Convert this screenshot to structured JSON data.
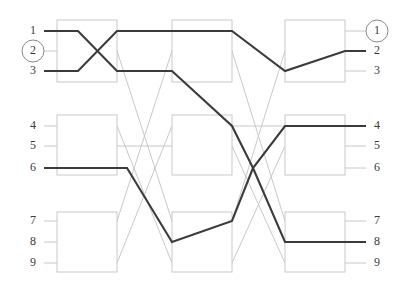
{
  "figure": {
    "width": 406,
    "height": 290,
    "background_color": "#ffffff",
    "active_wire_color": "#3b3b3b",
    "dim_wire_color": "#c2c2c2",
    "box_stroke_color": "#c9c9c9",
    "label_color": "#3a3a3a",
    "ring_color": "#8a8a8a"
  },
  "left_labels": [
    {
      "text": "1",
      "y": 31,
      "ringed": false
    },
    {
      "text": "2",
      "y": 51,
      "ringed": true
    },
    {
      "text": "3",
      "y": 71,
      "ringed": false
    },
    {
      "text": "4",
      "y": 126,
      "ringed": false
    },
    {
      "text": "5",
      "y": 146,
      "ringed": false
    },
    {
      "text": "6",
      "y": 168,
      "ringed": false
    },
    {
      "text": "7",
      "y": 221,
      "ringed": false
    },
    {
      "text": "8",
      "y": 242,
      "ringed": false
    },
    {
      "text": "9",
      "y": 263,
      "ringed": false
    }
  ],
  "right_labels": [
    {
      "text": "1",
      "y": 31,
      "ringed": true
    },
    {
      "text": "2",
      "y": 51,
      "ringed": false
    },
    {
      "text": "3",
      "y": 71,
      "ringed": false
    },
    {
      "text": "4",
      "y": 126,
      "ringed": false
    },
    {
      "text": "5",
      "y": 146,
      "ringed": false
    },
    {
      "text": "6",
      "y": 168,
      "ringed": false
    },
    {
      "text": "7",
      "y": 221,
      "ringed": false
    },
    {
      "text": "8",
      "y": 242,
      "ringed": false
    },
    {
      "text": "9",
      "y": 263,
      "ringed": false
    }
  ],
  "label_geometry": {
    "left_label_x": 33,
    "right_label_x": 377,
    "ring_radius": 11,
    "left_stub_start": 44,
    "right_stub_end": 366
  },
  "columns": [
    {
      "name": "column-1",
      "x": 57,
      "width": 60
    },
    {
      "name": "column-2",
      "x": 172,
      "width": 60
    },
    {
      "name": "column-3",
      "x": 285,
      "width": 60
    }
  ],
  "box_rows": [
    {
      "name": "row-top",
      "y": 20,
      "height": 62
    },
    {
      "name": "row-middle",
      "y": 115,
      "height": 60
    },
    {
      "name": "row-bottom",
      "y": 212,
      "height": 60
    }
  ],
  "stage_x": {
    "entry": 44,
    "c1_left": 57,
    "c1_right": 117,
    "c2_left": 172,
    "c2_right": 232,
    "c3_left": 285,
    "c3_right": 345,
    "exit": 366
  },
  "rows_y": {
    "r1": 31,
    "r2": 51,
    "r3": 71,
    "r4": 126,
    "r5": 146,
    "r6": 168,
    "r7": 221,
    "r8": 242,
    "r9": 263
  },
  "dim_wires": [
    {
      "name": "dim-in-2",
      "points": "44,51 57,51"
    },
    {
      "name": "dim-in-4",
      "points": "44,126 57,126"
    },
    {
      "name": "dim-in-5",
      "points": "44,146 57,146"
    },
    {
      "name": "dim-in-7",
      "points": "44,221 57,221"
    },
    {
      "name": "dim-in-8",
      "points": "44,242 57,242"
    },
    {
      "name": "dim-in-9",
      "points": "44,263 57,263"
    },
    {
      "name": "dim-box1-2",
      "points": "57,51 117,51"
    },
    {
      "name": "dim-box1-4",
      "points": "57,126 117,126"
    },
    {
      "name": "dim-box1-5",
      "points": "57,146 117,146"
    },
    {
      "name": "dim-box1-7",
      "points": "57,221 117,221"
    },
    {
      "name": "dim-box1-9",
      "points": "57,263 117,263"
    },
    {
      "name": "dim-cross-a",
      "points": "117,51 172,221"
    },
    {
      "name": "dim-cross-b",
      "points": "117,126 172,263"
    },
    {
      "name": "dim-cross-c",
      "points": "117,221 172,51"
    },
    {
      "name": "dim-cross-d",
      "points": "117,263 172,126"
    },
    {
      "name": "dim-cross-e",
      "points": "117,146 172,146"
    },
    {
      "name": "dim-box2-2",
      "points": "172,51 232,51"
    },
    {
      "name": "dim-box2-5",
      "points": "172,146 232,146"
    },
    {
      "name": "dim-box2-9",
      "points": "172,263 232,263"
    },
    {
      "name": "dim-cross-f",
      "points": "232,51 285,221"
    },
    {
      "name": "dim-cross-g",
      "points": "232,146 285,263"
    },
    {
      "name": "dim-cross-h",
      "points": "232,221 285,51"
    },
    {
      "name": "dim-cross-i",
      "points": "232,263 285,146"
    },
    {
      "name": "dim-cross-j",
      "points": "232,126 285,126"
    },
    {
      "name": "dim-box3-1",
      "points": "285,31 345,31"
    },
    {
      "name": "dim-box3-3",
      "points": "285,71 345,71"
    },
    {
      "name": "dim-box3-5",
      "points": "285,146 345,146"
    },
    {
      "name": "dim-box3-6",
      "points": "285,168 345,168"
    },
    {
      "name": "dim-box3-7",
      "points": "285,221 345,221"
    },
    {
      "name": "dim-box3-9",
      "points": "285,263 345,263"
    },
    {
      "name": "dim-out-1",
      "points": "345,31 366,31"
    },
    {
      "name": "dim-out-3",
      "points": "345,71 366,71"
    },
    {
      "name": "dim-out-5",
      "points": "345,146 366,146"
    },
    {
      "name": "dim-out-6",
      "points": "345,168 366,168"
    },
    {
      "name": "dim-out-7",
      "points": "345,221 366,221"
    },
    {
      "name": "dim-out-9",
      "points": "345,263 366,263"
    }
  ],
  "active_wires": [
    {
      "name": "active-path-a",
      "from": "input-1",
      "to": "output-8",
      "points": "44,31 57,31 78,31 117,71 172,71 232,126 253,168 285,242 345,242 366,242"
    },
    {
      "name": "active-path-b",
      "from": "input-3",
      "to": "output-2",
      "points": "44,71 57,71 78,71 117,31 172,31 232,31 285,71 345,51 366,51"
    },
    {
      "name": "active-path-c",
      "from": "input-6",
      "to": "output-4",
      "points": "44,168 57,168 117,168 127,168 172,242 232,221 253,168 285,126 345,126 366,126"
    }
  ],
  "boxes": [
    {
      "name": "box-c1-top",
      "x": 57,
      "y": 20,
      "w": 60,
      "h": 62
    },
    {
      "name": "box-c1-middle",
      "x": 57,
      "y": 115,
      "w": 60,
      "h": 60
    },
    {
      "name": "box-c1-bottom",
      "x": 57,
      "y": 212,
      "w": 60,
      "h": 60
    },
    {
      "name": "box-c2-top",
      "x": 172,
      "y": 20,
      "w": 60,
      "h": 62
    },
    {
      "name": "box-c2-middle",
      "x": 172,
      "y": 115,
      "w": 60,
      "h": 60
    },
    {
      "name": "box-c2-bottom",
      "x": 172,
      "y": 212,
      "w": 60,
      "h": 60
    },
    {
      "name": "box-c3-top",
      "x": 285,
      "y": 20,
      "w": 60,
      "h": 62
    },
    {
      "name": "box-c3-middle",
      "x": 285,
      "y": 115,
      "w": 60,
      "h": 60
    },
    {
      "name": "box-c3-bottom",
      "x": 285,
      "y": 212,
      "w": 60,
      "h": 60
    }
  ]
}
